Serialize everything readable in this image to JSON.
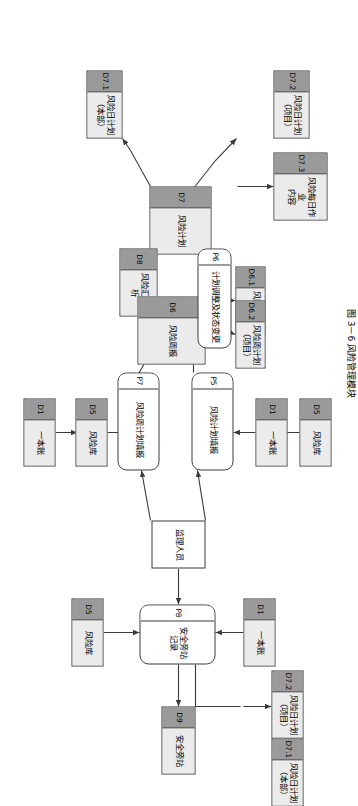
{
  "figure": {
    "caption": "图 3－6  风险管理模块",
    "type": "data-flow-diagram"
  },
  "nodes": {
    "d7_2_top": {
      "id": "D7.2",
      "label": "风险日计划\n（项目）",
      "kind": "data-store"
    },
    "d7_3": {
      "id": "D7.3",
      "label": "风险每日作业\n内容",
      "kind": "data-store"
    },
    "d7_1_top": {
      "id": "D7.1",
      "label": "风险日计划\n（本部）",
      "kind": "data-store"
    },
    "d7": {
      "id": "D7",
      "label": "风险计划",
      "kind": "data-store"
    },
    "d8": {
      "id": "D8",
      "label": "风险汇总分析",
      "kind": "data-store"
    },
    "d6_1": {
      "id": "D6.1",
      "label": "风险周计划\n（本部）",
      "kind": "data-store"
    },
    "d6_2": {
      "id": "D6.2",
      "label": "风险周计划\n（项目）",
      "kind": "data-store"
    },
    "d6": {
      "id": "D6",
      "label": "风险周报",
      "kind": "data-store"
    },
    "d5_left": {
      "id": "D5",
      "label": "风险库",
      "kind": "data-store"
    },
    "d5_right": {
      "id": "D5",
      "label": "风险库",
      "kind": "data-store"
    },
    "d5_bottom": {
      "id": "D5",
      "label": "风险库",
      "kind": "data-store"
    },
    "d1_left": {
      "id": "D1",
      "label": "一本账",
      "kind": "data-store"
    },
    "d1_right": {
      "id": "D1",
      "label": "一本账",
      "kind": "data-store"
    },
    "d1_bottom": {
      "id": "D1",
      "label": "一本账",
      "kind": "data-store"
    },
    "d9": {
      "id": "D9",
      "label": "安全旁站",
      "kind": "data-store"
    },
    "d7_2_bot": {
      "id": "D7.2",
      "label": "风险日计划\n（项目）",
      "kind": "data-store"
    },
    "d7_1_bot": {
      "id": "D7.1",
      "label": "风险日计划\n（本部）",
      "kind": "data-store"
    },
    "p5": {
      "id": "P5",
      "label": "风险计划填报",
      "kind": "process"
    },
    "p6": {
      "id": "P6",
      "label": "计划调整及状态变更",
      "kind": "process"
    },
    "p7": {
      "id": "P7",
      "label": "风险周计划填报",
      "kind": "process"
    },
    "p8": {
      "id": "P8",
      "label": "安全旁站记录",
      "kind": "process"
    },
    "actor": {
      "id": "",
      "label": "监理人员",
      "kind": "external-entity"
    }
  },
  "colors": {
    "store_body": "#ebebeb",
    "store_id_band": "#9a9a9a",
    "stroke": "#3a3a3a",
    "process_body": "#ffffff",
    "background": "#ffffff"
  }
}
